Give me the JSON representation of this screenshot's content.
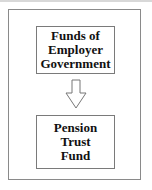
{
  "diagram": {
    "source_box": {
      "label": "Funds of\nEmployer\nGovernment"
    },
    "arrow": {
      "direction": "down",
      "icon": "down-arrow-icon"
    },
    "target_box": {
      "label": "Pension\nTrust\nFund"
    }
  }
}
